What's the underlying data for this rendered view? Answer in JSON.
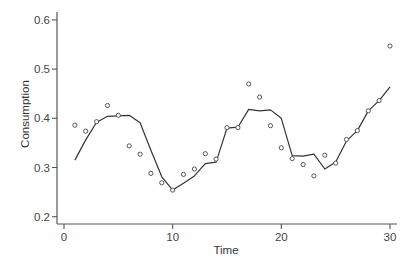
{
  "chart_data": {
    "type": "scatter",
    "title": "",
    "xlabel": "Time",
    "ylabel": "Consumption",
    "xlim": [
      0,
      30
    ],
    "ylim": [
      0.2,
      0.6
    ],
    "xticks": [
      "0",
      "10",
      "20",
      "30"
    ],
    "yticks": [
      "0.2",
      "0.3",
      "0.4",
      "0.5",
      "0.6"
    ],
    "grid": false,
    "legend": null,
    "x": [
      1,
      2,
      3,
      4,
      5,
      6,
      7,
      8,
      9,
      10,
      11,
      12,
      13,
      14,
      15,
      16,
      17,
      18,
      19,
      20,
      21,
      22,
      23,
      24,
      25,
      26,
      27,
      28,
      29,
      30
    ],
    "series": [
      {
        "name": "Observed",
        "style": "open-circle markers",
        "values": [
          0.386,
          0.374,
          0.393,
          0.426,
          0.406,
          0.344,
          0.327,
          0.288,
          0.269,
          0.254,
          0.286,
          0.297,
          0.328,
          0.317,
          0.381,
          0.381,
          0.47,
          0.443,
          0.385,
          0.34,
          0.318,
          0.306,
          0.283,
          0.325,
          0.309,
          0.357,
          0.375,
          0.415,
          0.436,
          0.547
        ]
      },
      {
        "name": "Fitted",
        "style": "solid line",
        "values": [
          0.315,
          0.356,
          0.392,
          0.404,
          0.405,
          0.406,
          0.391,
          0.335,
          0.281,
          0.254,
          0.268,
          0.283,
          0.308,
          0.311,
          0.38,
          0.382,
          0.418,
          0.415,
          0.417,
          0.4,
          0.324,
          0.323,
          0.327,
          0.297,
          0.311,
          0.354,
          0.375,
          0.415,
          0.436,
          0.464
        ]
      }
    ]
  },
  "axes": {
    "x_title": "Time",
    "y_title": "Consumption"
  },
  "colors": {
    "axis": "#555555",
    "line": "#333333",
    "marker": "#444444",
    "background": "#ffffff"
  }
}
